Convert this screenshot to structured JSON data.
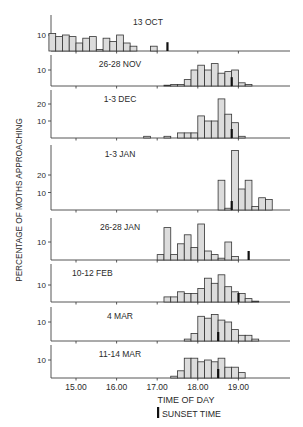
{
  "chart_data": {
    "type": "bar",
    "title": "",
    "xlabel": "TIME OF DAY",
    "ylabel": "PERCENTAGE OF MOTHS APPROACHING",
    "legend": {
      "label": "SUNSET TIME",
      "placement": "bottom-center"
    },
    "x_range_hours": [
      14.333,
      20.2
    ],
    "bin_minutes": 10,
    "x_ticks": [
      15,
      16,
      17,
      18,
      19
    ],
    "x_tick_labels": [
      "15.00",
      "16.00",
      "17.00",
      "18.00",
      "19.00"
    ],
    "grid": false,
    "panels": [
      {
        "label": "13 OCT",
        "y_ticks": [
          10
        ],
        "ymax": 13,
        "sunset": 17.25,
        "bins": [
          {
            "start": 14.333,
            "value": 11
          },
          {
            "start": 14.5,
            "value": 9
          },
          {
            "start": 14.667,
            "value": 10
          },
          {
            "start": 14.833,
            "value": 9
          },
          {
            "start": 15.0,
            "value": 5
          },
          {
            "start": 15.167,
            "value": 8
          },
          {
            "start": 15.333,
            "value": 9
          },
          {
            "start": 15.5,
            "value": 1
          },
          {
            "start": 15.667,
            "value": 8
          },
          {
            "start": 15.833,
            "value": 6
          },
          {
            "start": 16.0,
            "value": 10
          },
          {
            "start": 16.167,
            "value": 5
          },
          {
            "start": 16.333,
            "value": 3
          },
          {
            "start": 16.833,
            "value": 3
          }
        ]
      },
      {
        "label": "26-28 NOV",
        "y_ticks": [
          10
        ],
        "ymax": 15,
        "sunset": 18.833,
        "bins": [
          {
            "start": 17.167,
            "value": 0.5
          },
          {
            "start": 17.333,
            "value": 1
          },
          {
            "start": 17.5,
            "value": 1
          },
          {
            "start": 17.667,
            "value": 4
          },
          {
            "start": 17.833,
            "value": 10
          },
          {
            "start": 18.0,
            "value": 13
          },
          {
            "start": 18.167,
            "value": 10
          },
          {
            "start": 18.333,
            "value": 14
          },
          {
            "start": 18.5,
            "value": 8
          },
          {
            "start": 18.667,
            "value": 9
          },
          {
            "start": 18.833,
            "value": 10
          },
          {
            "start": 19.0,
            "value": 2
          },
          {
            "start": 19.167,
            "value": 1
          }
        ]
      },
      {
        "label": "1-3 DEC",
        "y_ticks": [
          10,
          20
        ],
        "ymax": 27,
        "sunset": 18.833,
        "bins": [
          {
            "start": 16.667,
            "value": 1
          },
          {
            "start": 17.167,
            "value": 1
          },
          {
            "start": 17.5,
            "value": 3
          },
          {
            "start": 17.667,
            "value": 3
          },
          {
            "start": 17.833,
            "value": 3
          },
          {
            "start": 18.0,
            "value": 13
          },
          {
            "start": 18.167,
            "value": 10
          },
          {
            "start": 18.333,
            "value": 10
          },
          {
            "start": 18.5,
            "value": 23
          },
          {
            "start": 18.667,
            "value": 14
          },
          {
            "start": 18.833,
            "value": 9
          },
          {
            "start": 19.0,
            "value": 1
          }
        ]
      },
      {
        "label": "1-3 JAN",
        "y_ticks": [
          10,
          20
        ],
        "ymax": 36,
        "sunset": 18.833,
        "bins": [
          {
            "start": 18.5,
            "value": 17
          },
          {
            "start": 18.667,
            "value": 1
          },
          {
            "start": 18.833,
            "value": 34
          },
          {
            "start": 19.0,
            "value": 12
          },
          {
            "start": 19.167,
            "value": 17
          },
          {
            "start": 19.333,
            "value": 2
          },
          {
            "start": 19.5,
            "value": 7
          },
          {
            "start": 19.667,
            "value": 6
          }
        ]
      },
      {
        "label": "26-28 JAN",
        "y_ticks": [
          10
        ],
        "ymax": 22,
        "sunset": 19.25,
        "bins": [
          {
            "start": 17.0,
            "value": 3
          },
          {
            "start": 17.167,
            "value": 18
          },
          {
            "start": 17.333,
            "value": 3
          },
          {
            "start": 17.5,
            "value": 9
          },
          {
            "start": 17.667,
            "value": 14
          },
          {
            "start": 17.833,
            "value": 7
          },
          {
            "start": 18.0,
            "value": 20
          },
          {
            "start": 18.167,
            "value": 5
          },
          {
            "start": 18.333,
            "value": 3
          },
          {
            "start": 18.5,
            "value": 1
          },
          {
            "start": 18.667,
            "value": 10
          },
          {
            "start": 18.833,
            "value": 2
          }
        ]
      },
      {
        "label": "10-12 FEB",
        "y_ticks": [
          10
        ],
        "ymax": 18,
        "sunset": 19.0,
        "bins": [
          {
            "start": 17.167,
            "value": 3
          },
          {
            "start": 17.333,
            "value": 3
          },
          {
            "start": 17.5,
            "value": 6
          },
          {
            "start": 17.667,
            "value": 5
          },
          {
            "start": 17.833,
            "value": 5
          },
          {
            "start": 18.0,
            "value": 8
          },
          {
            "start": 18.167,
            "value": 14
          },
          {
            "start": 18.333,
            "value": 11
          },
          {
            "start": 18.5,
            "value": 16
          },
          {
            "start": 18.667,
            "value": 9
          },
          {
            "start": 18.833,
            "value": 6
          },
          {
            "start": 19.0,
            "value": 5
          },
          {
            "start": 19.167,
            "value": 2
          },
          {
            "start": 19.333,
            "value": 0.5
          }
        ]
      },
      {
        "label": "4 MAR",
        "y_ticks": [
          10
        ],
        "ymax": 18,
        "sunset": 18.5,
        "bins": [
          {
            "start": 17.667,
            "value": 1
          },
          {
            "start": 17.833,
            "value": 4
          },
          {
            "start": 18.0,
            "value": 13
          },
          {
            "start": 18.167,
            "value": 12
          },
          {
            "start": 18.333,
            "value": 14
          },
          {
            "start": 18.5,
            "value": 11
          },
          {
            "start": 18.667,
            "value": 10
          },
          {
            "start": 18.833,
            "value": 6
          },
          {
            "start": 19.0,
            "value": 3
          },
          {
            "start": 19.167,
            "value": 3
          },
          {
            "start": 19.333,
            "value": 1
          }
        ]
      },
      {
        "label": "11-14 MAR",
        "y_ticks": [
          10
        ],
        "ymax": 15,
        "sunset": 18.5,
        "bins": [
          {
            "start": 17.333,
            "value": 1
          },
          {
            "start": 17.5,
            "value": 4
          },
          {
            "start": 17.667,
            "value": 11
          },
          {
            "start": 17.833,
            "value": 11
          },
          {
            "start": 18.0,
            "value": 9
          },
          {
            "start": 18.167,
            "value": 10
          },
          {
            "start": 18.333,
            "value": 9
          },
          {
            "start": 18.5,
            "value": 11
          },
          {
            "start": 18.667,
            "value": 6
          },
          {
            "start": 18.833,
            "value": 6
          },
          {
            "start": 19.0,
            "value": 3
          }
        ]
      }
    ]
  }
}
